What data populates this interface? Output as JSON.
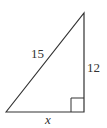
{
  "diagram": {
    "type": "right-triangle",
    "stroke_color": "#333333",
    "labels": {
      "hypotenuse": "15",
      "vertical_leg": "12",
      "horizontal_leg": "x"
    },
    "right_angle_marker": true
  }
}
